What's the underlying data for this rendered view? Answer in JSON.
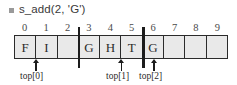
{
  "title": {
    "bullet_icon": "square-bullet-icon",
    "text": "s_add(2, 'G')"
  },
  "tape": {
    "indices": [
      "0",
      "1",
      "2",
      "3",
      "4",
      "5",
      "6",
      "7",
      "8",
      "9"
    ],
    "cells": [
      {
        "index": "0",
        "value": "F"
      },
      {
        "index": "1",
        "value": "I"
      },
      {
        "index": "2",
        "value": ""
      },
      {
        "index": "3",
        "value": "G"
      },
      {
        "index": "4",
        "value": "H"
      },
      {
        "index": "5",
        "value": "T"
      },
      {
        "index": "6",
        "value": "G"
      },
      {
        "index": "7",
        "value": ""
      },
      {
        "index": "8",
        "value": ""
      },
      {
        "index": "9",
        "value": ""
      }
    ],
    "cell_fill_color": "#e9e9e9",
    "border_color": "#2b2b2b"
  },
  "dividers": [
    {
      "name": "partition-after-index-2",
      "at_boundary": 3
    },
    {
      "name": "partition-after-index-5",
      "at_boundary": 6
    }
  ],
  "pointers": [
    {
      "label": "top[0]",
      "points_to_index": 1
    },
    {
      "label": "top[1]",
      "points_to_index": 5
    },
    {
      "label": "top[2]",
      "points_to_index": 6
    }
  ]
}
